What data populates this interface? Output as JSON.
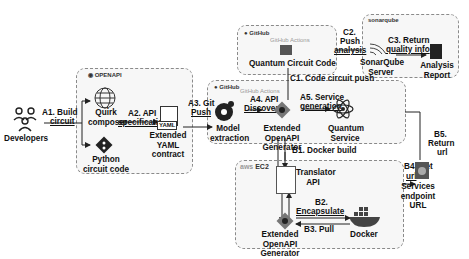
{
  "actors": {
    "developers": "Developers"
  },
  "logos": {
    "openapi": "OPENAPI",
    "github": "GitHub",
    "github_actions": "GitHub Actions",
    "sonarqube": "sonarqube",
    "aws": "aws",
    "ec2": "EC2"
  },
  "nodes": {
    "quirk": "Quirk composer",
    "python": "Python circuit code",
    "yaml_tag": "YAML",
    "yaml": "Extended YAML contract",
    "quantum_code": "Quantum Circuit Code",
    "sonar_server": "SonarQube Server",
    "analysis_report": "Analysis Report",
    "model_extraction": "Model extraction",
    "ext_openapi_gen": "Extended OpenAPI Generator",
    "quantum_service": "Quantum Service",
    "translator_api": "Translator API",
    "ext_openapi_gen_2": "Extended OpenAPI Generator",
    "docker": "Docker",
    "services_url": "Services endpoint URL"
  },
  "steps": {
    "a1": "A1. Build",
    "a1b": "circuit",
    "a2": "A2. API",
    "a2b": "specification",
    "a3": "A3. Git",
    "a3b": "Push",
    "a4": "A4. API",
    "a4b": "Discoverer",
    "a5": "A5. Service",
    "a5b": "generation",
    "b1": "B1. Docker build",
    "b2": "B2.",
    "b2b": "Encapsulate",
    "b3": "B3. Pull",
    "b4": "B4. Get",
    "b4b": "url",
    "b5": "B5.",
    "b5b": "Return",
    "b5c": "url",
    "c1": "C1. Code circuit push",
    "c2": "C2.",
    "c2b": "Push",
    "c2c": "analysis",
    "c3": "C3. Return",
    "c3b": "quality info"
  },
  "colors": {
    "box_border": "#8a8a8a",
    "box_fill": "#f7f7f7",
    "line": "#222222"
  }
}
